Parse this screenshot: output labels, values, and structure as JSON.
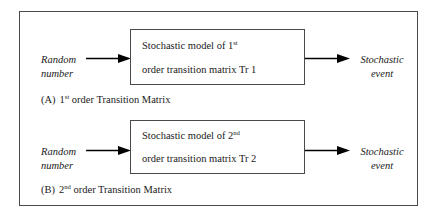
{
  "figure": {
    "border_color": "#4a4a4a",
    "background": "#ffffff",
    "text_color": "#1a1a1a",
    "arrow_color": "#000000"
  },
  "panels": [
    {
      "id": "panel-a",
      "input_label_line1": "Random",
      "input_label_line2": "number",
      "output_label_line1": "Stochastic",
      "output_label_line2": "event",
      "box_line1_prefix": "Stochastic model of 1",
      "box_line1_sup": "st",
      "box_line2": "order transition matrix  Tr 1",
      "caption_tag": "(A)",
      "caption_prefix": "1",
      "caption_sup": "st",
      "caption_suffix": " order Transition Matrix"
    },
    {
      "id": "panel-b",
      "input_label_line1": "Random",
      "input_label_line2": "number",
      "output_label_line1": "Stochastic",
      "output_label_line2": "event",
      "box_line1_prefix": "Stochastic model of 2",
      "box_line1_sup": "nd",
      "box_line2": "order transition matrix  Tr 2",
      "caption_tag": "(B)",
      "caption_prefix": "2",
      "caption_sup": "nd",
      "caption_suffix": " order Transition Matrix"
    }
  ],
  "icons": {
    "arrow_in": "arrow-right-icon",
    "arrow_out": "arrow-right-icon"
  }
}
